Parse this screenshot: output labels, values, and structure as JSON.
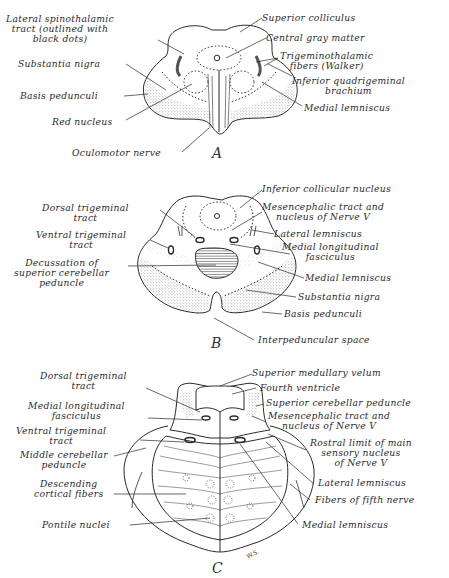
{
  "figure": {
    "panels": [
      {
        "letter": "A",
        "labels": {
          "lateral_spinothalamic": [
            "Lateral spinothalamic",
            "tract (outlined with",
            "black dots)"
          ],
          "substantia_nigra": "Substantia nigra",
          "basis_pedunculi": "Basis pedunculi",
          "red_nucleus": "Red nucleus",
          "oculomotor_nerve": "Oculomotor nerve",
          "superior_colliculus": "Superior colliculus",
          "central_gray_matter": "Central gray matter",
          "trigeminothalamic": [
            "Trigeminothalamic",
            "fibers (Walker)"
          ],
          "inferior_quadrigeminal": [
            "Inferior quadrigeminal",
            "brachium"
          ],
          "medial_lemniscus": "Medial lemniscus"
        }
      },
      {
        "letter": "B",
        "labels": {
          "dorsal_trigeminal": [
            "Dorsal trigeminal",
            "tract"
          ],
          "ventral_trigeminal": [
            "Ventral trigeminal",
            "tract"
          ],
          "decussation": [
            "Decussation of",
            "superior cerebellar",
            "peduncle"
          ],
          "inferior_collicular": "Inferior collicular nucleus",
          "mesencephalic": [
            "Mesencephalic tract and",
            "nucleus of Nerve V"
          ],
          "lateral_lemniscus": "Lateral lemniscus",
          "mlf": [
            "Medial longitudinal",
            "fasciculus"
          ],
          "medial_lemniscus": "Medial lemniscus",
          "substantia_nigra": "Substantia nigra",
          "basis_pedunculi": "Basis pedunculi",
          "interpeduncular_space": "Interpeduncular space"
        }
      },
      {
        "letter": "C",
        "signature": "W.S.",
        "labels": {
          "dorsal_trigeminal": [
            "Dorsal trigeminal",
            "tract"
          ],
          "mlf": [
            "Medial longitudinal",
            "fasciculus"
          ],
          "ventral_trigeminal": [
            "Ventral trigeminal",
            "tract"
          ],
          "middle_cerebellar": [
            "Middle cerebellar",
            "peduncle"
          ],
          "descending_cortical": [
            "Descending",
            "cortical fibers"
          ],
          "pontile_nuclei": "Pontile nuclei",
          "superior_medullary_velum": "Superior medullary velum",
          "fourth_ventricle": "Fourth ventricle",
          "superior_cerebellar_peduncle": "Superior cerebellar peduncle",
          "mesencephalic": [
            "Mesencephalic tract and",
            "nucleus of Nerve V"
          ],
          "rostral_limit": [
            "Rostral limit of main",
            "sensory nucleus",
            "of Nerve V"
          ],
          "lateral_lemniscus": "Lateral lemniscus",
          "fibers_fifth_nerve": "Fibers of fifth nerve",
          "medial_lemniscus": "Medial lemniscus"
        }
      }
    ],
    "colors": {
      "ink": "#2a2a2a",
      "stipple": "#bdbdbd",
      "paper": "#ffffff"
    }
  }
}
